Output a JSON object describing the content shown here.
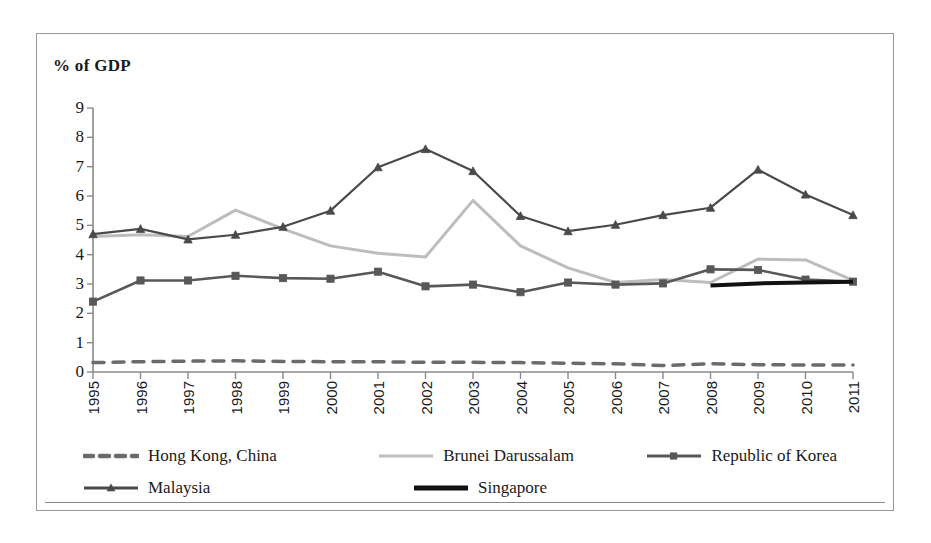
{
  "chart": {
    "title": "%  of GDP",
    "yaxis_label": "",
    "xaxis_label": ""
  },
  "legend": {
    "rows": [
      [
        {
          "label": "Hong Kong, China",
          "style": "dashed",
          "color": "#6b6b6b",
          "marker": "none"
        },
        {
          "label": "Brunei Darussalam",
          "style": "solid-light",
          "color": "#bdbdbd",
          "marker": "none"
        },
        {
          "label": "Republic of Korea",
          "style": "solid-marker",
          "color": "#585858",
          "marker": "square"
        }
      ],
      [
        {
          "label": "Malaysia",
          "style": "solid-marker",
          "color": "#4a4a4a",
          "marker": "triangle"
        },
        {
          "label": "Singapore",
          "style": "solid-thick",
          "color": "#111111",
          "marker": "none"
        }
      ]
    ]
  },
  "chart_data": {
    "type": "line",
    "title": "%  of GDP",
    "xlabel": "",
    "ylabel": "% of GDP",
    "ylim": [
      0,
      9
    ],
    "yticks": [
      0,
      1,
      2,
      3,
      4,
      5,
      6,
      7,
      8,
      9
    ],
    "grid": false,
    "legend_position": "bottom",
    "categories": [
      "1995",
      "1996",
      "1997",
      "1998",
      "1999",
      "2000",
      "2001",
      "2002",
      "2003",
      "2004",
      "2005",
      "2006",
      "2007",
      "2008",
      "2009",
      "2010",
      "2011"
    ],
    "series": [
      {
        "name": "Hong Kong, China",
        "color": "#6b6b6b",
        "style": "dashed",
        "marker": "none",
        "width": 3.5,
        "values": [
          0.32,
          0.35,
          0.37,
          0.38,
          0.36,
          0.35,
          0.35,
          0.33,
          0.33,
          0.32,
          0.3,
          0.28,
          0.22,
          0.28,
          0.25,
          0.24,
          0.24
        ]
      },
      {
        "name": "Brunei Darussalam",
        "color": "#bdbdbd",
        "style": "solid",
        "marker": "none",
        "width": 3,
        "values": [
          4.62,
          4.68,
          4.62,
          5.52,
          4.88,
          4.3,
          4.05,
          3.92,
          5.85,
          4.3,
          3.55,
          3.05,
          3.15,
          3.05,
          3.85,
          3.82,
          3.12
        ]
      },
      {
        "name": "Republic of Korea",
        "color": "#585858",
        "style": "solid",
        "marker": "square",
        "width": 2.6,
        "values": [
          2.4,
          3.12,
          3.12,
          3.28,
          3.2,
          3.18,
          3.42,
          2.92,
          2.98,
          2.72,
          3.05,
          2.98,
          3.02,
          3.5,
          3.48,
          3.15,
          3.08
        ]
      },
      {
        "name": "Malaysia",
        "color": "#4a4a4a",
        "style": "solid",
        "marker": "triangle",
        "width": 2.2,
        "values": [
          4.7,
          4.88,
          4.52,
          4.68,
          4.95,
          5.5,
          6.98,
          7.6,
          6.85,
          5.32,
          4.8,
          5.02,
          5.35,
          5.6,
          6.9,
          6.05,
          5.35
        ]
      },
      {
        "name": "Singapore",
        "color": "#111111",
        "style": "solid",
        "marker": "none",
        "width": 4,
        "values": [
          null,
          null,
          null,
          null,
          null,
          null,
          null,
          null,
          null,
          null,
          null,
          null,
          null,
          2.95,
          3.02,
          3.05,
          3.08
        ]
      }
    ]
  }
}
